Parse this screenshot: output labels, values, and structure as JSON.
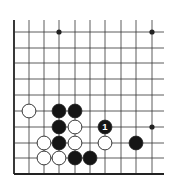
{
  "diagram": {
    "type": "go-board-fragment",
    "corner": "lower-left",
    "columns": 10,
    "rows": 10,
    "x_lines": [
      14,
      29,
      44,
      59,
      75,
      90,
      105,
      121,
      136,
      152
    ],
    "y_lines": [
      32,
      48,
      63,
      79,
      95,
      111,
      127,
      143,
      158,
      174
    ],
    "line_extent": {
      "top": 20,
      "right": 164
    },
    "colors": {
      "line": "#333333",
      "edge": "#222222",
      "black_stone": "#151515",
      "white_stone": "#ffffff",
      "stone_outline": "#222222",
      "label_on_black": "#ffffff"
    },
    "star_points": [
      {
        "col": 3,
        "row": 0
      },
      {
        "col": 9,
        "row": 0
      },
      {
        "col": 9,
        "row": 6
      }
    ],
    "stones": [
      {
        "color": "white",
        "col": 1,
        "row": 5,
        "label": ""
      },
      {
        "color": "black",
        "col": 3,
        "row": 5,
        "label": ""
      },
      {
        "color": "black",
        "col": 4,
        "row": 5,
        "label": ""
      },
      {
        "color": "black",
        "col": 3,
        "row": 6,
        "label": ""
      },
      {
        "color": "white",
        "col": 4,
        "row": 6,
        "label": ""
      },
      {
        "color": "black",
        "col": 6,
        "row": 6,
        "label": "1"
      },
      {
        "color": "white",
        "col": 2,
        "row": 7,
        "label": ""
      },
      {
        "color": "black",
        "col": 3,
        "row": 7,
        "label": ""
      },
      {
        "color": "white",
        "col": 4,
        "row": 7,
        "label": ""
      },
      {
        "color": "white",
        "col": 6,
        "row": 7,
        "label": ""
      },
      {
        "color": "black",
        "col": 8,
        "row": 7,
        "label": ""
      },
      {
        "color": "white",
        "col": 2,
        "row": 8,
        "label": ""
      },
      {
        "color": "white",
        "col": 3,
        "row": 8,
        "label": ""
      },
      {
        "color": "black",
        "col": 4,
        "row": 8,
        "label": ""
      },
      {
        "color": "black",
        "col": 5,
        "row": 8,
        "label": ""
      }
    ]
  }
}
